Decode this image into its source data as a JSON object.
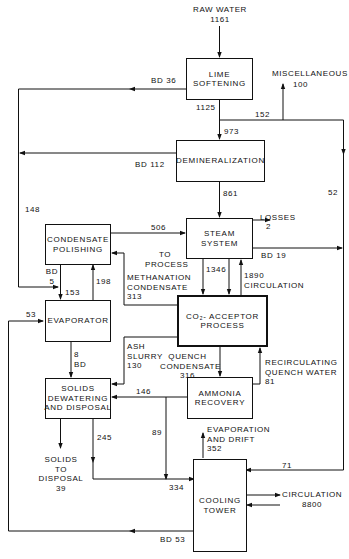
{
  "diagram": {
    "nodes": {
      "lime_softening": "LIME\nSOFTENING",
      "demineralization": "DEMINERALIZATION",
      "steam_system": "STEAM\nSYSTEM",
      "condensate_polishing": "CONDENSATE\nPOLISHING",
      "evaporator": "EVAPORATOR",
      "co2_acceptor": "CO₂- ACCEPTOR\nPROCESS",
      "solids_dewatering": "SOLIDS\nDEWATERING\nAND DISPOSAL",
      "ammonia_recovery": "AMMONIA\nRECOVERY",
      "cooling_tower": "COOLING\nTOWER"
    },
    "labels": {
      "raw_water": "RAW WATER",
      "raw_water_val": "1161",
      "bd36": "BD 36",
      "misc": "MISCELLANEOUS",
      "misc_val": "100",
      "v1125": "1125",
      "v152": "152",
      "v973": "973",
      "bd112": "BD  112",
      "v52": "52",
      "v861": "861",
      "v148": "148",
      "v506": "506",
      "losses": "LOSSES",
      "losses_val": "2",
      "bd19": "BD 19",
      "to_process": "TO\nPROCESS",
      "methanation": "METHANATION\nCONDENSATE\n313",
      "v1346": "1346",
      "v1890": "1890\nCIRCULATION",
      "bd5": "BD\n5",
      "v153": "153",
      "v198": "198",
      "v53": "53",
      "ash_slurry": "ASH\nSLURRY\n130",
      "quench": "QUENCH\nCONDENSATE\n316",
      "recirc": "RECIRCULATING\nQUENCH WATER\n81",
      "v8bd": "8\nBD",
      "v146": "146",
      "v245": "245",
      "v89": "89",
      "solids_disposal": "SOLIDS\nTO\nDISPOSAL\n39",
      "evap_drift": "EVAPORATION\nAND DRIFT\n352",
      "v71": "71",
      "v334": "334",
      "circulation": "CIRCULATION\n8800",
      "bd53": "BD 53"
    }
  }
}
